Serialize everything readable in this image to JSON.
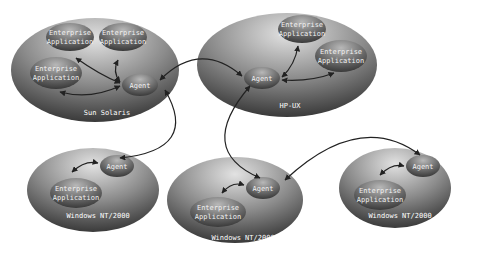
{
  "diagram": {
    "type": "network-topology",
    "platforms": [
      {
        "id": "sun",
        "label": "Sun Solaris",
        "apps": [
          "Enterprise Application",
          "Enterprise Application",
          "Enterprise Application"
        ],
        "agent": "Agent"
      },
      {
        "id": "hpux",
        "label": "HP-UX",
        "apps": [
          "Enterprise Application",
          "Enterprise Application"
        ],
        "agent": "Agent"
      },
      {
        "id": "win1",
        "label": "Windows NT/2000",
        "apps": [
          "Enterprise Application"
        ],
        "agent": "Agent"
      },
      {
        "id": "win2",
        "label": "Windows NT/2000",
        "apps": [
          "Enterprise Application"
        ],
        "agent": "Agent"
      },
      {
        "id": "win3",
        "label": "Windows NT/2000",
        "apps": [
          "Enterprise Application"
        ],
        "agent": "Agent"
      }
    ],
    "text": {
      "ea_line1": "Enterprise",
      "ea_line2": "Application",
      "agent": "Agent",
      "sun": "Sun Solaris",
      "hpux": "HP-UX",
      "win": "Windows NT/2000"
    },
    "connections": [
      [
        "sun.agent",
        "hpux.agent"
      ],
      [
        "sun.agent",
        "win1.agent"
      ],
      [
        "hpux.agent",
        "win2.agent"
      ],
      [
        "win2.agent",
        "win3.agent"
      ]
    ],
    "colors": {
      "platform_light": "#d8d8d8",
      "platform_dark": "#3a3a3a",
      "node_light": "#b0b0b0",
      "node_dark": "#3c3c3c",
      "arrow": "#222222"
    }
  }
}
